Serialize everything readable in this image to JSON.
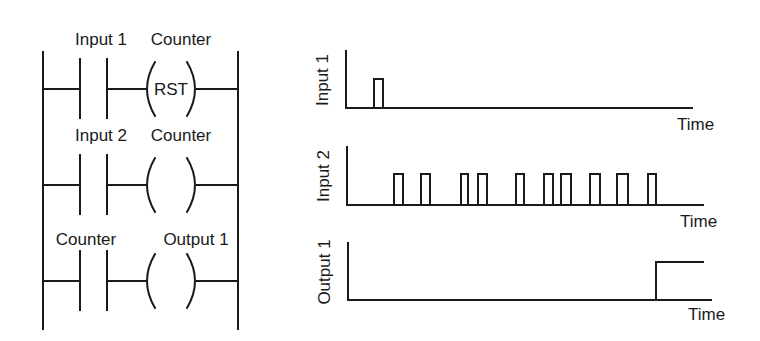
{
  "colors": {
    "ink": "#1a1a1a",
    "background": "#ffffff"
  },
  "ladder": {
    "left_rail_x": 43,
    "right_rail_x": 238,
    "rail_top": 52,
    "rail_bottom": 329,
    "contact_left_x": 80,
    "contact_right_x": 107,
    "coil_left_x": 145,
    "coil_right_x": 197,
    "rungs": [
      {
        "y": 89,
        "contact_label": "Input 1",
        "coil_label": "Counter",
        "coil_text": "RST",
        "contact_label_x": 101,
        "coil_label_x": 181,
        "label_y": 45
      },
      {
        "y": 185,
        "contact_label": "Input 2",
        "coil_label": "Counter",
        "coil_text": "",
        "contact_label_x": 101,
        "coil_label_x": 181,
        "label_y": 141
      },
      {
        "y": 281,
        "contact_label": "Counter",
        "coil_label": "Output 1",
        "coil_text": "",
        "contact_label_x": 86,
        "coil_label_x": 196,
        "label_y": 245
      }
    ]
  },
  "chart_data": [
    {
      "type": "line",
      "title": "",
      "ylabel": "Input 1",
      "xlabel": "Time",
      "style": "digital timing waveform",
      "axis": {
        "x0": 346,
        "y_top": 51,
        "y_base": 108,
        "x_end": 692,
        "high_y": 79
      },
      "label_pos": {
        "ylabel_x": 328,
        "ylabel_y": 80,
        "xlabel_x": 677,
        "xlabel_y": 130
      },
      "pulses": [
        [
          374,
          383
        ]
      ],
      "step_at": null
    },
    {
      "type": "line",
      "title": "",
      "ylabel": "Input 2",
      "xlabel": "Time",
      "style": "digital timing waveform",
      "axis": {
        "x0": 347,
        "y_top": 147,
        "y_base": 205,
        "x_end": 703,
        "high_y": 174
      },
      "label_pos": {
        "ylabel_x": 329,
        "ylabel_y": 176,
        "xlabel_x": 680,
        "xlabel_y": 227
      },
      "pulses": [
        [
          394,
          403
        ],
        [
          421,
          430
        ],
        [
          461,
          468
        ],
        [
          478,
          487
        ],
        [
          516,
          524
        ],
        [
          544,
          553
        ],
        [
          561,
          571
        ],
        [
          590,
          600
        ],
        [
          617,
          628
        ],
        [
          648,
          656
        ]
      ],
      "pulse_count": 10,
      "step_at": null
    },
    {
      "type": "line",
      "title": "",
      "ylabel": "Output 1",
      "xlabel": "Time",
      "style": "digital timing waveform",
      "axis": {
        "x0": 348,
        "y_top": 243,
        "y_base": 300,
        "x_end": 711,
        "high_y": 262,
        "high_end": 703
      },
      "label_pos": {
        "ylabel_x": 330,
        "ylabel_y": 272,
        "xlabel_x": 688,
        "xlabel_y": 320
      },
      "pulses": [],
      "step_at": 656
    }
  ]
}
